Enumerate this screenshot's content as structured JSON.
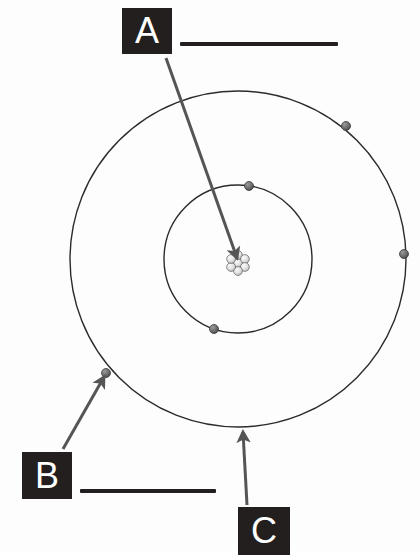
{
  "worksheet": {
    "title": "Atom structure labeling worksheet",
    "background_color": "#fdfdfd",
    "ink_color": "#231f1f"
  },
  "diagram": {
    "name": "bohr-atomic-model",
    "center": {
      "x": 238,
      "y": 259
    },
    "nucleus": {
      "label": "nucleus",
      "center_x": 238,
      "center_y": 263,
      "radius": 11,
      "particle_count": 7,
      "particle_radius": 4.2,
      "fill_color": "#e8e8e8",
      "stroke_color": "#6e6e6e"
    },
    "shells": [
      {
        "name": "inner-shell",
        "radius": 74,
        "stroke_color": "#2b2b2b",
        "stroke_width": 1.4,
        "electron_count": 2
      },
      {
        "name": "outer-shell",
        "radius": 168,
        "stroke_color": "#2b2b2b",
        "stroke_width": 1.4,
        "electron_count": 3
      }
    ],
    "electrons": [
      {
        "name": "electron-inner-top",
        "x": 249,
        "y": 186,
        "radius": 4.5,
        "shell": "inner-shell"
      },
      {
        "name": "electron-inner-bottom",
        "x": 214,
        "y": 329,
        "radius": 4.5,
        "shell": "inner-shell"
      },
      {
        "name": "electron-outer-upper-right",
        "x": 346,
        "y": 126,
        "radius": 4.5,
        "shell": "outer-shell"
      },
      {
        "name": "electron-outer-right",
        "x": 404,
        "y": 254,
        "radius": 4.5,
        "shell": "outer-shell"
      },
      {
        "name": "electron-outer-lower-left",
        "x": 106,
        "y": 373,
        "radius": 4.5,
        "shell": "outer-shell"
      }
    ],
    "electron_fill_color": "#6e6e6e",
    "electron_stroke_color": "#3d3d3d"
  },
  "callouts": [
    {
      "id": "a",
      "letter": "A",
      "answer_value": "",
      "answer_placeholder": "",
      "points_to": "nucleus",
      "arrow": {
        "from_x": 166,
        "from_y": 58,
        "to_x": 237,
        "to_y": 258,
        "color": "#555555",
        "width": 3
      }
    },
    {
      "id": "b",
      "letter": "B",
      "answer_value": "",
      "answer_placeholder": "",
      "points_to": "electron-outer-lower-left",
      "arrow": {
        "from_x": 63,
        "from_y": 449,
        "to_x": 104,
        "to_y": 377,
        "color": "#555555",
        "width": 3
      }
    },
    {
      "id": "c",
      "letter": "C",
      "answer_value": "",
      "answer_placeholder": "",
      "points_to": "outer-shell",
      "arrow": {
        "from_x": 247,
        "from_y": 505,
        "to_x": 243,
        "to_y": 432,
        "color": "#555555",
        "width": 3
      }
    }
  ],
  "answer_lines": [
    {
      "id": "answer-line-a",
      "for_letter": "A",
      "value": ""
    },
    {
      "id": "answer-line-b",
      "for_letter": "B",
      "value": ""
    }
  ]
}
